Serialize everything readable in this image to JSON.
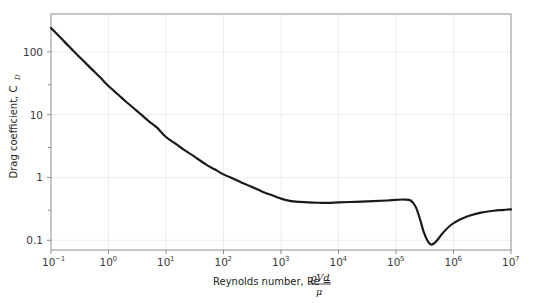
{
  "chart_data": {
    "type": "line",
    "title": "",
    "xlabel": "Reynolds number, Re = ρVd/μ",
    "xlabel_text": "Reynolds number, Re =",
    "xlabel_numerator": "ρVd",
    "xlabel_denominator": "μ",
    "ylabel": "Drag coefficient, C_D",
    "ylabel_main": "Drag coefficient, C",
    "ylabel_sub": "D",
    "xscale": "log",
    "yscale": "log",
    "xlim": [
      0.1,
      10000000
    ],
    "ylim": [
      0.07,
      400
    ],
    "grid": true,
    "legend": "none",
    "xticks": [
      {
        "value": 0.1,
        "mantissa": "10",
        "exponent": "−1"
      },
      {
        "value": 1,
        "mantissa": "10",
        "exponent": "0"
      },
      {
        "value": 10,
        "mantissa": "10",
        "exponent": "1"
      },
      {
        "value": 100,
        "mantissa": "10",
        "exponent": "2"
      },
      {
        "value": 1000,
        "mantissa": "10",
        "exponent": "3"
      },
      {
        "value": 10000,
        "mantissa": "10",
        "exponent": "4"
      },
      {
        "value": 100000,
        "mantissa": "10",
        "exponent": "5"
      },
      {
        "value": 1000000,
        "mantissa": "10",
        "exponent": "6"
      },
      {
        "value": 10000000,
        "mantissa": "10",
        "exponent": "7"
      }
    ],
    "yticks": [
      {
        "value": 100,
        "label": "100"
      },
      {
        "value": 10,
        "label": "10"
      },
      {
        "value": 1,
        "label": "1"
      },
      {
        "value": 0.1,
        "label": "0.1"
      }
    ],
    "yminor_ticks": [
      30,
      3,
      0.3
    ],
    "series": [
      {
        "name": "Sphere drag coefficient",
        "color": "#1a1a1a",
        "linewidth": 2.2,
        "points": [
          [
            0.1,
            240
          ],
          [
            0.15,
            164
          ],
          [
            0.2,
            125
          ],
          [
            0.3,
            86
          ],
          [
            0.5,
            54
          ],
          [
            0.7,
            40
          ],
          [
            1.0,
            28.5
          ],
          [
            1.5,
            20.5
          ],
          [
            2.0,
            16.2
          ],
          [
            3.0,
            11.8
          ],
          [
            5.0,
            7.9
          ],
          [
            7.0,
            6.2
          ],
          [
            10,
            4.4
          ],
          [
            15,
            3.4
          ],
          [
            20,
            2.8
          ],
          [
            30,
            2.2
          ],
          [
            50,
            1.6
          ],
          [
            70,
            1.35
          ],
          [
            100,
            1.12
          ],
          [
            150,
            0.95
          ],
          [
            200,
            0.84
          ],
          [
            300,
            0.72
          ],
          [
            500,
            0.58
          ],
          [
            700,
            0.52
          ],
          [
            1000,
            0.46
          ],
          [
            1500,
            0.42
          ],
          [
            2000,
            0.41
          ],
          [
            3000,
            0.4
          ],
          [
            5000,
            0.395
          ],
          [
            7000,
            0.393
          ],
          [
            10000,
            0.4
          ],
          [
            20000,
            0.41
          ],
          [
            40000,
            0.42
          ],
          [
            70000,
            0.43
          ],
          [
            100000,
            0.44
          ],
          [
            140000,
            0.445
          ],
          [
            180000,
            0.43
          ],
          [
            220000,
            0.34
          ],
          [
            260000,
            0.22
          ],
          [
            300000,
            0.14
          ],
          [
            350000,
            0.1
          ],
          [
            400000,
            0.086
          ],
          [
            450000,
            0.088
          ],
          [
            520000,
            0.1
          ],
          [
            650000,
            0.13
          ],
          [
            900000,
            0.175
          ],
          [
            1300000,
            0.215
          ],
          [
            2000000,
            0.25
          ],
          [
            3000000,
            0.275
          ],
          [
            5000000,
            0.295
          ],
          [
            7000000,
            0.303
          ],
          [
            10000000,
            0.31
          ]
        ]
      }
    ],
    "colors": {
      "curve": "#1a1a1a",
      "grid": "#ececec",
      "axis": "#8d8d8d",
      "text": "#231f20",
      "background": "#ffffff"
    }
  },
  "plot_geometry": {
    "left": 51,
    "right": 511,
    "top": 14,
    "bottom": 250
  }
}
